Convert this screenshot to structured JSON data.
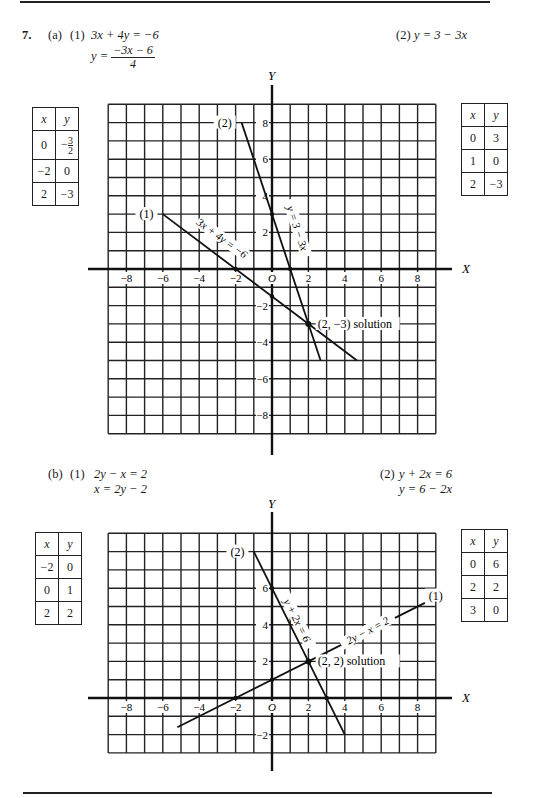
{
  "problem": {
    "number": "7.",
    "part_a": {
      "label": "(a)",
      "eq1": {
        "label": "(1)",
        "line1": "3x + 4y = −6",
        "line2_lhs": "y =",
        "line2_num": "−3x − 6",
        "line2_den": "4"
      },
      "eq2": {
        "label": "(2)",
        "line1": "y = 3 − 3x"
      },
      "table1": {
        "headers": [
          "x",
          "y"
        ],
        "rows": [
          [
            "0",
            "−3/2"
          ],
          [
            "−2",
            "0"
          ],
          [
            "2",
            "−3"
          ]
        ]
      },
      "table2": {
        "headers": [
          "x",
          "y"
        ],
        "rows": [
          [
            "0",
            "3"
          ],
          [
            "1",
            "0"
          ],
          [
            "2",
            "−3"
          ]
        ]
      }
    },
    "part_b": {
      "label": "(b)",
      "eq1": {
        "label": "(1)",
        "line1": "2y − x = 2",
        "line2": "x = 2y − 2"
      },
      "eq2": {
        "label": "(2)",
        "line1": "y + 2x = 6",
        "line2": "y = 6 − 2x"
      },
      "table1": {
        "headers": [
          "x",
          "y"
        ],
        "rows": [
          [
            "−2",
            "0"
          ],
          [
            "0",
            "1"
          ],
          [
            "2",
            "2"
          ]
        ]
      },
      "table2": {
        "headers": [
          "x",
          "y"
        ],
        "rows": [
          [
            "0",
            "6"
          ],
          [
            "2",
            "2"
          ],
          [
            "3",
            "0"
          ]
        ]
      }
    }
  },
  "chart_data": [
    {
      "type": "line",
      "title": "7(a)",
      "xlabel": "X",
      "ylabel": "Y",
      "xlim": [
        -9,
        9
      ],
      "ylim": [
        -9,
        9
      ],
      "grid": true,
      "x_ticks": [
        "−8",
        "−6",
        "−4",
        "−2",
        "O",
        "2",
        "4",
        "6",
        "8"
      ],
      "y_ticks": [
        "8",
        "6",
        "4",
        "2",
        "−2",
        "−4",
        "−6",
        "−8"
      ],
      "series": [
        {
          "name": "(1) 3x + 4y = −6",
          "label": "(1)",
          "annotation": "3x + 4y = −6",
          "points": [
            [
              -6,
              3
            ],
            [
              4.67,
              -5
            ]
          ],
          "marked": [
            [
              -2,
              0
            ],
            [
              0,
              -1.5
            ],
            [
              2,
              -3
            ]
          ]
        },
        {
          "name": "(2) y = 3 − 3x",
          "label": "(2)",
          "annotation": "y = 3 − 3x",
          "points": [
            [
              -1.67,
              8
            ],
            [
              2.67,
              -5
            ]
          ],
          "marked": [
            [
              0,
              3
            ],
            [
              1,
              0
            ],
            [
              2,
              -3
            ]
          ]
        }
      ],
      "solution": {
        "point": [
          2,
          -3
        ],
        "label": "(2, −3) solution"
      }
    },
    {
      "type": "line",
      "title": "7(b)",
      "xlabel": "X",
      "ylabel": "Y",
      "xlim": [
        -9,
        9
      ],
      "ylim": [
        -3,
        9
      ],
      "grid": true,
      "x_ticks": [
        "−8",
        "−6",
        "−4",
        "−2",
        "O",
        "2",
        "4",
        "6",
        "8"
      ],
      "y_ticks": [
        "6",
        "4",
        "2",
        "−2"
      ],
      "series": [
        {
          "name": "(1) 2y − x = 2",
          "label": "(1)",
          "annotation": "2y − x = 2",
          "points": [
            [
              -5.2,
              -1.6
            ],
            [
              8.4,
              5.2
            ]
          ],
          "marked": [
            [
              -2,
              0
            ],
            [
              0,
              1
            ],
            [
              2,
              2
            ]
          ]
        },
        {
          "name": "(2) y + 2x = 6",
          "label": "(2)",
          "annotation": "y + 2x = 6",
          "points": [
            [
              -1,
              8
            ],
            [
              4,
              -2
            ]
          ],
          "marked": [
            [
              0,
              6
            ],
            [
              2,
              2
            ],
            [
              3,
              0
            ]
          ]
        }
      ],
      "solution": {
        "point": [
          2,
          2
        ],
        "label": "(2, 2) solution"
      }
    }
  ]
}
